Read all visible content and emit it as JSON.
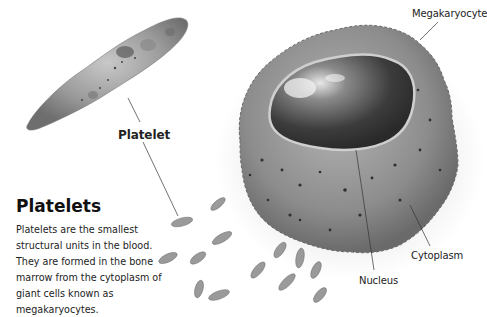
{
  "caption": {
    "title": "Platelets",
    "body": "Platelets are the smallest structural units in the blood. They are formed in the bone marrow from the cytoplasm of giant cells known as megakaryocytes."
  },
  "labels": {
    "platelet": "Platelet",
    "megakaryocyte": "Megakaryocyte",
    "nucleus": "Nucleus",
    "cytoplasm": "Cytoplasm"
  },
  "colors": {
    "background": "#ffffff",
    "cell_gray": "#8a8a8a",
    "nucleus_dark": "#3a3a3a",
    "text": "#1a1a1a"
  }
}
